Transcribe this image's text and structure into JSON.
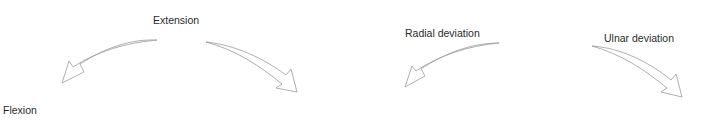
{
  "diagram": {
    "panels": [
      {
        "name": "flexion-extension",
        "labels": {
          "top": "Extension",
          "bottom_left": "Flexion"
        },
        "arrows": [
          {
            "name": "arrow-toward-flexion",
            "direction": "down-left"
          },
          {
            "name": "arrow-toward-extension-right",
            "direction": "down-right"
          }
        ]
      },
      {
        "name": "radial-ulnar-deviation",
        "labels": {
          "left": "Radial deviation",
          "right": "Ulnar deviation"
        },
        "arrows": [
          {
            "name": "arrow-radial-deviation",
            "direction": "down-left"
          },
          {
            "name": "arrow-ulnar-deviation",
            "direction": "down-right"
          }
        ]
      }
    ],
    "colors": {
      "text": "#2a2a2a",
      "arrow_outline": "#9a9a9a",
      "background": "#ffffff"
    }
  }
}
